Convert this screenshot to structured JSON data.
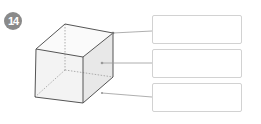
{
  "problem": {
    "number": "14"
  },
  "figure": {
    "type": "cube",
    "style": {
      "edge_color": "#555555",
      "hidden_edge_color": "#9a9a9a",
      "leader_color": "#9a9a9a",
      "face_fill": "#f2f2f2",
      "side_fill": "#e6e6e6"
    }
  },
  "answers": [
    {
      "label": "vertex answer box",
      "value": ""
    },
    {
      "label": "face answer box",
      "value": ""
    },
    {
      "label": "edge answer box",
      "value": ""
    }
  ],
  "colors": {
    "badge": "#8a8a8a",
    "box_border": "#d2d2d2"
  }
}
